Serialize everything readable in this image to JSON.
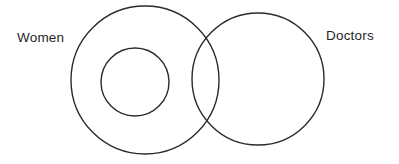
{
  "diagram": {
    "type": "venn",
    "title": "",
    "background_color": "#ffffff",
    "stroke_color": "#2b2b2b",
    "text_color": "#1f1f1f",
    "labels": {
      "women": "Women",
      "doctors": "Doctors"
    },
    "sets": [
      {
        "id": "women",
        "label": "Women",
        "shape": "circle",
        "cx": 145,
        "cy": 80,
        "r": 74,
        "label_x": 17,
        "label_y": 42
      },
      {
        "id": "doctors",
        "label": "Doctors",
        "shape": "circle",
        "cx": 258,
        "cy": 79,
        "r": 66,
        "label_x": 326,
        "label_y": 40
      },
      {
        "id": "inner-subset",
        "label": "",
        "shape": "circle",
        "cx": 135,
        "cy": 82,
        "r": 34,
        "label_x": 0,
        "label_y": 0
      }
    ]
  }
}
